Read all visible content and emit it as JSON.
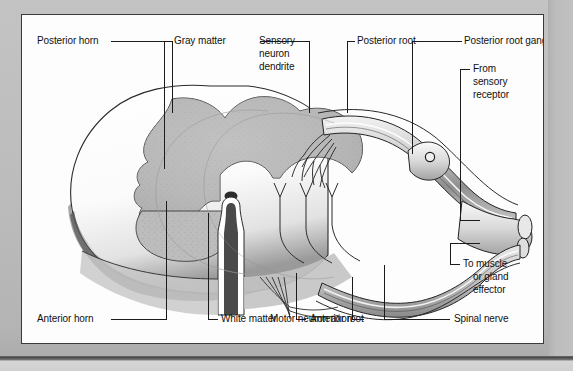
{
  "page": {
    "kind": "scanned-textbook-figure",
    "background_color": "#bcbcbc",
    "panel_color": "#fdfdfd",
    "panel_border_color": "#3a3a3a",
    "ink_color": "#1b1b1b"
  },
  "figure": {
    "gray_matter_color": "#b6b6b6",
    "white_matter_color": "#fbfbfb",
    "nerve_shading_color": "#8d8d8d"
  },
  "labels": {
    "posterior_horn": "Posterior horn",
    "gray_matter": "Gray matter",
    "sensory_neuron_dendrite_l1": "Sensory",
    "sensory_neuron_dendrite_l2": "neuron",
    "sensory_neuron_dendrite_l3": "dendrite",
    "posterior_root": "Posterior root",
    "posterior_root_ganglion": "Posterior root ganglion",
    "from_sensory_receptor_l1": "From",
    "from_sensory_receptor_l2": "sensory",
    "from_sensory_receptor_l3": "receptor",
    "to_effector_l1": "To muscle",
    "to_effector_l2": "or gland",
    "to_effector_l3": "effector",
    "spinal_nerve": "Spinal nerve",
    "motor_neuron_axon": "Motor neuron axon",
    "anterior_root": "Anterior root",
    "white_matter": "White matter",
    "anterior_horn": "Anterior horn"
  }
}
